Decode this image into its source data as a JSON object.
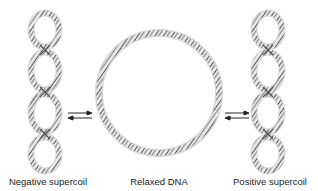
{
  "diagram": {
    "structures": [
      {
        "id": "negative",
        "label": "Negative supercoil",
        "loops": 4
      },
      {
        "id": "relaxed",
        "label": "Relaxed DNA",
        "shape": "circle"
      },
      {
        "id": "positive",
        "label": "Positive supercoil",
        "loops": 4
      }
    ],
    "arrows": [
      {
        "between": [
          "negative",
          "relaxed"
        ],
        "type": "equilibrium"
      },
      {
        "between": [
          "relaxed",
          "positive"
        ],
        "type": "equilibrium"
      }
    ],
    "colors": {
      "strand": "#5a5a5a",
      "strand_light": "#9a9a9a",
      "halo": "#d8d8d8",
      "arrow": "#222222",
      "text": "#222222"
    }
  }
}
